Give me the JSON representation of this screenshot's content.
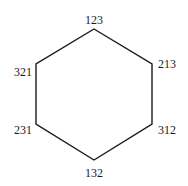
{
  "diagram": {
    "type": "hexagon-graph",
    "stroke_color": "#1a1a1a",
    "background": "#ffffff",
    "vertices": [
      {
        "id": "top",
        "label": "123",
        "x": 94,
        "y": 29,
        "label_x": 94,
        "label_y": 24,
        "anchor": "middle"
      },
      {
        "id": "upper-right",
        "label": "213",
        "x": 152,
        "y": 64,
        "label_x": 158,
        "label_y": 68,
        "anchor": "start"
      },
      {
        "id": "lower-right",
        "label": "312",
        "x": 152,
        "y": 124,
        "label_x": 158,
        "label_y": 134,
        "anchor": "start"
      },
      {
        "id": "bottom",
        "label": "132",
        "x": 94,
        "y": 160,
        "label_x": 94,
        "label_y": 177,
        "anchor": "middle"
      },
      {
        "id": "lower-left",
        "label": "231",
        "x": 36,
        "y": 124,
        "label_x": 32,
        "label_y": 134,
        "anchor": "end"
      },
      {
        "id": "upper-left",
        "label": "321",
        "x": 36,
        "y": 64,
        "label_x": 32,
        "label_y": 76,
        "anchor": "end"
      }
    ],
    "edges": [
      [
        "top",
        "upper-right"
      ],
      [
        "upper-right",
        "lower-right"
      ],
      [
        "lower-right",
        "bottom"
      ],
      [
        "bottom",
        "lower-left"
      ],
      [
        "lower-left",
        "upper-left"
      ],
      [
        "upper-left",
        "top"
      ]
    ]
  }
}
